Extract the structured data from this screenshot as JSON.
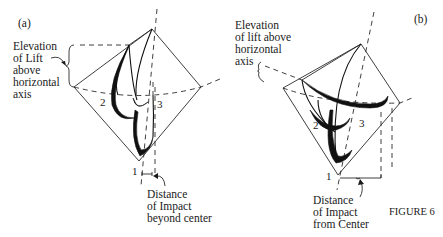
{
  "figure": {
    "caption": "FIGURE 6",
    "panels": [
      {
        "id": "a",
        "tag": "(a)",
        "top_label": [
          "Elevation",
          "of Lift",
          "above",
          "horizontal",
          "axis"
        ],
        "bottom_label": [
          "Distance",
          "of Impact",
          "beyond center"
        ],
        "points": {
          "p1": "1",
          "p2": "2",
          "p3": "3"
        }
      },
      {
        "id": "b",
        "tag": "(b)",
        "top_label": [
          "Elevation",
          "of lift above",
          "horizontal",
          "axis"
        ],
        "bottom_label": [
          "Distance",
          "of Impact",
          "from Center"
        ],
        "points": {
          "p1": "1",
          "p2": "2",
          "p3": "3"
        }
      }
    ]
  },
  "colors": {
    "ink": "#1a1a1a",
    "background": "#ffffff"
  }
}
